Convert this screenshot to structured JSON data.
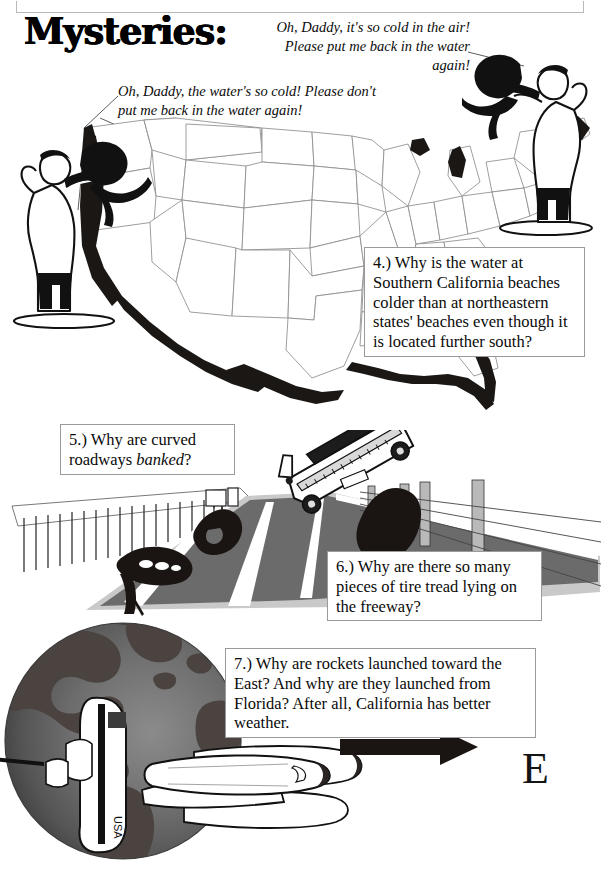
{
  "page": {
    "title": "Mysteries:",
    "background_color": "#ffffff"
  },
  "speech_bubbles": [
    {
      "id": "right-speech",
      "text": "Oh, Daddy,  it's so cold in the air! Please put me back in the water again!",
      "speaker": "child-held-by-man-right"
    },
    {
      "id": "left-speech",
      "text": "Oh, Daddy, the water's so cold!  Please don't put me back in the water again!",
      "speaker": "child-held-by-man-left"
    }
  ],
  "questions": [
    {
      "number": "4.)",
      "text": "4.) Why is the water at Southern California beaches colder than at northeastern states' beaches even though it is located further south?"
    },
    {
      "number": "5.)",
      "text_before": "5.) Why are curved roadways ",
      "emphasis": "banked",
      "text_after": "?"
    },
    {
      "number": "6.)",
      "text": "6.) Why are there so many pieces of tire tread lying on the freeway?"
    },
    {
      "number": "7.)",
      "text": "7.) Why are rockets launched toward the East? And why are they launched from Florida?  After all, California has better weather."
    }
  ],
  "labels": {
    "east_direction": "E",
    "shuttle_marking": "USA"
  },
  "colors": {
    "ink": "#111111",
    "box_border": "#9a9a9a",
    "map_state_line": "#8d8d8d",
    "coastline_fill": "#1b1714",
    "road_asphalt": "#6b6b6b",
    "road_shoulder": "#c9c9c9",
    "globe_ocean": "#6e6e6e",
    "globe_land": "#4a4340",
    "arrow": "#1a1412"
  },
  "scenes": [
    {
      "name": "us-map-with-fathers-and-children",
      "region": "top"
    },
    {
      "name": "banked-freeway-with-car-and-tire-treads",
      "region": "middle"
    },
    {
      "name": "globe-with-space-shuttle-and-east-arrow",
      "region": "bottom"
    }
  ]
}
